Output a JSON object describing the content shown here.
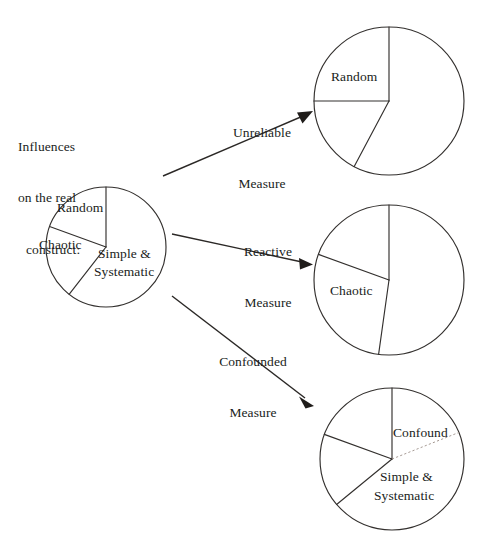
{
  "figure": {
    "caption": "Influences\non the real\nconstruct:",
    "caption_lines": [
      "Influences",
      "on the real",
      "construct:"
    ]
  },
  "source_pie": {
    "name": "real-construct-pie",
    "center": [
      106,
      247
    ],
    "radius": 60,
    "slices": [
      {
        "label": "Random",
        "start_deg": 90,
        "end_deg": 160
      },
      {
        "label": "Chaotic",
        "start_deg": 160,
        "end_deg": 232
      },
      {
        "label": "Simple &\nSystematic",
        "start_deg": 232,
        "end_deg": 450
      }
    ],
    "slice_labels": [
      "Random",
      "Chaotic",
      "Simple &",
      "Systematic"
    ]
  },
  "arrows": [
    {
      "name": "unreliable-measure-arrow",
      "label_line1": "Unreliable",
      "label_line2": "Measure",
      "from": [
        163,
        176
      ],
      "to": [
        313,
        112
      ]
    },
    {
      "name": "reactive-measure-arrow",
      "label_line1": "Reactive",
      "label_line2": "Measure",
      "from": [
        172,
        234
      ],
      "to": [
        313,
        265
      ]
    },
    {
      "name": "confounded-measure-arrow",
      "label_line1": "Confounded",
      "label_line2": "Measure",
      "from": [
        172,
        296
      ],
      "to": [
        313,
        406
      ]
    }
  ],
  "result_pies": [
    {
      "name": "unreliable-measure-pie",
      "center": [
        389,
        101
      ],
      "radius": 75,
      "labels": [
        "Random"
      ],
      "slices": [
        {
          "label": "Random",
          "start_deg": 90,
          "end_deg": 180
        },
        {
          "label": "",
          "start_deg": 180,
          "end_deg": 242
        },
        {
          "label": "",
          "start_deg": 242,
          "end_deg": 450
        }
      ]
    },
    {
      "name": "reactive-measure-pie",
      "center": [
        389,
        280
      ],
      "radius": 75,
      "labels": [
        "Chaotic"
      ],
      "slices": [
        {
          "label": "",
          "start_deg": 90,
          "end_deg": 160
        },
        {
          "label": "Chaotic",
          "start_deg": 160,
          "end_deg": 262
        },
        {
          "label": "",
          "start_deg": 262,
          "end_deg": 450
        }
      ]
    },
    {
      "name": "confounded-measure-pie",
      "center": [
        392,
        459
      ],
      "radius": 72,
      "labels": [
        "Confound",
        "Simple &",
        "Systematic"
      ],
      "slices": [
        {
          "label": "Confound",
          "start_deg": 68,
          "end_deg": 90,
          "boundary": "dotted"
        },
        {
          "label": "",
          "start_deg": 90,
          "end_deg": 160
        },
        {
          "label": "",
          "start_deg": 160,
          "end_deg": 232
        },
        {
          "label": "Simple &\nSystematic",
          "start_deg": 232,
          "end_deg": 428
        }
      ]
    }
  ],
  "style": {
    "stroke": "#33302e",
    "faint_stroke": "#9c8f88",
    "text": "#201d1b",
    "background": "#ffffff"
  }
}
